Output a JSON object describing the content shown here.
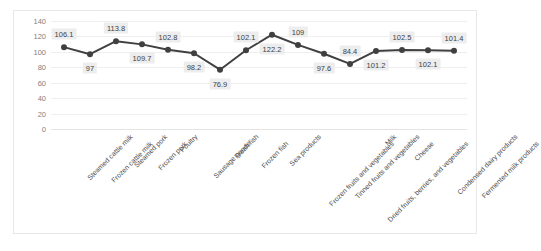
{
  "chart_data": {
    "type": "line",
    "title": "",
    "xlabel": "",
    "ylabel": "",
    "ylim": [
      0,
      140
    ],
    "yticks": [
      140,
      120,
      100,
      80,
      60,
      40,
      20,
      0
    ],
    "grid": true,
    "legend": "none",
    "series_color": "#404040",
    "label_bg_color": "#ededed",
    "categories": [
      "Steamed cattle milk",
      "Frozen cattle milk",
      "Steamed pork",
      "Frozen pork",
      "Poultry",
      "Sausage goods",
      "Fresh fish",
      "Frozen fish",
      "Sea products",
      "Frozen fruits and vegetables",
      "Tinned fruits and vegetables",
      "Dried fruits, berries, and vegetables",
      "Milk",
      "Cheese",
      "Condensed dairy products",
      "Fermented milk products"
    ],
    "values": [
      106.1,
      97,
      113.8,
      109.7,
      102.8,
      98.2,
      76.9,
      102.1,
      122.2,
      109,
      97.6,
      84.4,
      101.2,
      102.5,
      102.1,
      101.4
    ],
    "point_labels": [
      "106.1",
      "97",
      "113.8",
      "109.7",
      "102.8",
      "98.2",
      "76.9",
      "102.1",
      "122.2",
      "109",
      "97.6",
      "84.4",
      "101.2",
      "102.5",
      "102.1",
      "101.4"
    ],
    "label_side": [
      "above",
      "below",
      "above",
      "below",
      "above",
      "below",
      "below",
      "above",
      "below",
      "above",
      "below",
      "above",
      "below",
      "above",
      "below",
      "above"
    ]
  }
}
